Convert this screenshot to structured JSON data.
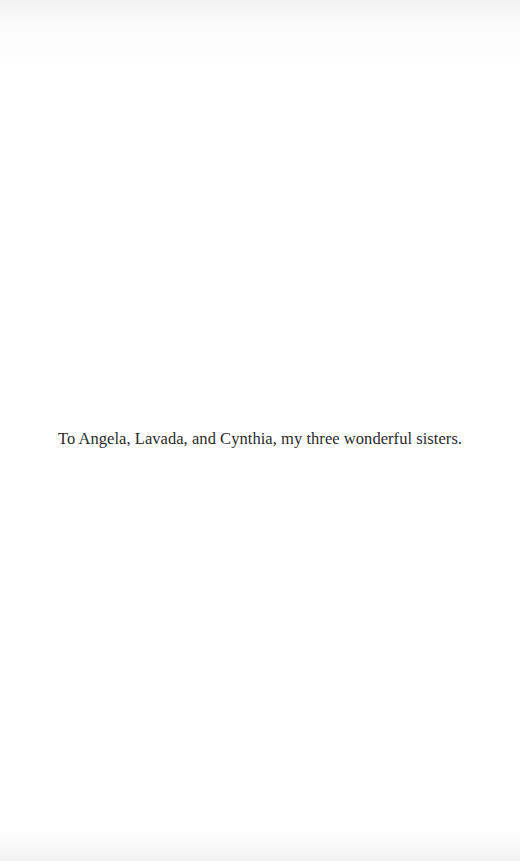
{
  "page": {
    "type": "dedication",
    "dedication_text": "To Angela, Lavada, and Cynthia, my three wonderful sisters."
  },
  "colors": {
    "background": "#ffffff",
    "text": "#2a2a2a"
  }
}
